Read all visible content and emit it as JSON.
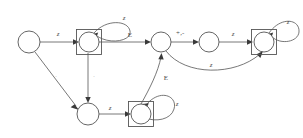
{
  "diagram": {
    "stroke_color": "#555555",
    "label_color": "#4a4a4a",
    "faint_label_color": "#b9b9b9",
    "background": "#ffffff"
  },
  "states": [
    {
      "id": "q0",
      "label": "",
      "cx": 29,
      "cy": 42,
      "r": 11,
      "accepting": false
    },
    {
      "id": "q1",
      "label": "",
      "cx": 89,
      "cy": 42,
      "r": 10,
      "accepting": true
    },
    {
      "id": "q3",
      "label": "",
      "cx": 161,
      "cy": 42,
      "r": 10,
      "accepting": false
    },
    {
      "id": "q6",
      "label": "",
      "cx": 209,
      "cy": 42,
      "r": 10,
      "accepting": false
    },
    {
      "id": "q7",
      "label": "",
      "cx": 264,
      "cy": 42,
      "r": 10,
      "accepting": true
    },
    {
      "id": "q4",
      "label": "",
      "cx": 88,
      "cy": 114,
      "r": 11,
      "accepting": false
    },
    {
      "id": "q5",
      "label": "",
      "cx": 141,
      "cy": 114,
      "r": 10,
      "accepting": true
    }
  ],
  "transitions": [
    {
      "id": "t0",
      "from": "q0",
      "to": "q1",
      "label": "z",
      "lx": 58,
      "ly": 34,
      "faint": false,
      "italic": true
    },
    {
      "id": "t1",
      "from": "q1",
      "to": "q1",
      "label": "z",
      "lx": 124,
      "ly": 18,
      "faint": false,
      "italic": true
    },
    {
      "id": "t2",
      "from": "q1",
      "to": "q3",
      "label": "E",
      "lx": 130,
      "ly": 35,
      "faint": false,
      "italic": false
    },
    {
      "id": "t3",
      "from": "q0",
      "to": "q4",
      "label": ".",
      "lx": 56,
      "ly": 76,
      "faint": true,
      "italic": false
    },
    {
      "id": "t4",
      "from": "q1",
      "to": "q4",
      "label": ".",
      "lx": 94,
      "ly": 76,
      "faint": true,
      "italic": false
    },
    {
      "id": "t5",
      "from": "q4",
      "to": "q5",
      "label": "z",
      "lx": 110,
      "ly": 108,
      "faint": false,
      "italic": true
    },
    {
      "id": "t6",
      "from": "q5",
      "to": "q5",
      "label": "z",
      "lx": 177,
      "ly": 104,
      "faint": false,
      "italic": true
    },
    {
      "id": "t7",
      "from": "q5",
      "to": "q3",
      "label": "E",
      "lx": 166,
      "ly": 78,
      "faint": false,
      "italic": false
    },
    {
      "id": "t8",
      "from": "q3",
      "to": "q6",
      "label": "+,-",
      "lx": 180,
      "ly": 33,
      "faint": false,
      "italic": true
    },
    {
      "id": "t9",
      "from": "q6",
      "to": "q7",
      "label": "z",
      "lx": 233,
      "ly": 34,
      "faint": false,
      "italic": true
    },
    {
      "id": "t10",
      "from": "q3",
      "to": "q7",
      "label": "z",
      "lx": 211,
      "ly": 65,
      "faint": false,
      "italic": true
    },
    {
      "id": "t11",
      "from": "q7",
      "to": "q7",
      "label": "z",
      "lx": 288,
      "ly": 22,
      "faint": false,
      "italic": true
    }
  ]
}
